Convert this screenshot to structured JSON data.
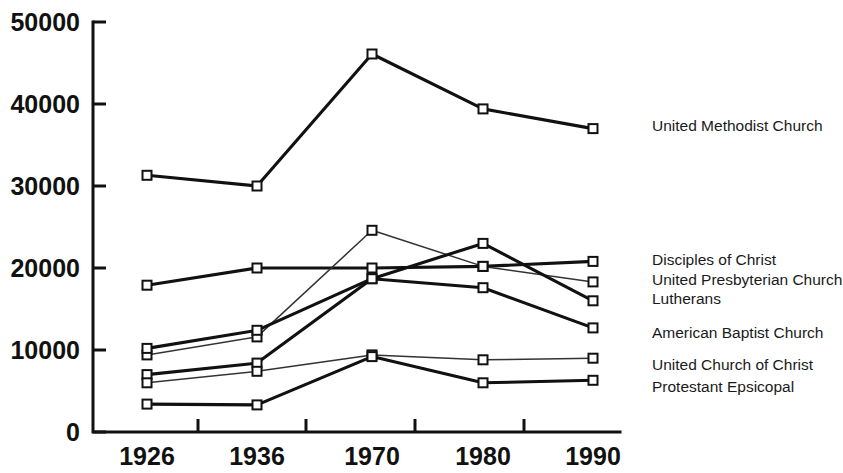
{
  "chart_data": {
    "type": "line",
    "title": "",
    "subtitle": "",
    "xlabel": "",
    "ylabel": "",
    "grid": false,
    "legend_position": "right-inline",
    "categories": [
      "1926",
      "1936",
      "1970",
      "1980",
      "1990"
    ],
    "x": [
      1926,
      1936,
      1970,
      1980,
      1990
    ],
    "xtick_labels": [
      "1926",
      "1936",
      "1970",
      "1980",
      "1990"
    ],
    "ytick_labels": [
      "0",
      "10000",
      "20000",
      "30000",
      "40000",
      "50000"
    ],
    "ytick_values": [
      0,
      10000,
      20000,
      30000,
      40000,
      50000
    ],
    "ylim": [
      0,
      50000
    ],
    "series": [
      {
        "name": "United Methodist Church",
        "style": "thick",
        "values": [
          31300,
          30000,
          46100,
          39400,
          37000
        ],
        "label_y": 128
      },
      {
        "name": "Disciples of Christ",
        "style": "thick",
        "values": [
          17900,
          20000,
          20000,
          20200,
          20800
        ],
        "label_y": 262
      },
      {
        "name": "United Presbyterian Church",
        "style": "thin",
        "values": [
          9400,
          11600,
          24600,
          20200,
          18300
        ],
        "label_y": 282
      },
      {
        "name": "Lutherans",
        "style": "thick",
        "values": [
          10200,
          12400,
          18700,
          23000,
          16000
        ],
        "label_y": 301
      },
      {
        "name": "American Baptist Church",
        "style": "thick",
        "values": [
          7000,
          8400,
          18700,
          17600,
          12700
        ],
        "label_y": 335
      },
      {
        "name": "United Church of Christ",
        "style": "thin",
        "values": [
          6000,
          7400,
          9400,
          8800,
          9000
        ],
        "label_y": 367
      },
      {
        "name": "Protestant Epsicopal",
        "style": "thick",
        "values": [
          3400,
          3300,
          9200,
          6000,
          6300
        ],
        "label_y": 389
      }
    ]
  },
  "geometry": {
    "plot_left": 93,
    "plot_right": 620,
    "plot_top": 22,
    "plot_bottom": 432,
    "data_x": [
      147,
      257,
      372,
      483,
      593
    ],
    "tick_x": [
      93,
      198,
      306,
      415,
      524
    ],
    "label_x": [
      147,
      257,
      372,
      483,
      593
    ],
    "marker_size": 9
  }
}
